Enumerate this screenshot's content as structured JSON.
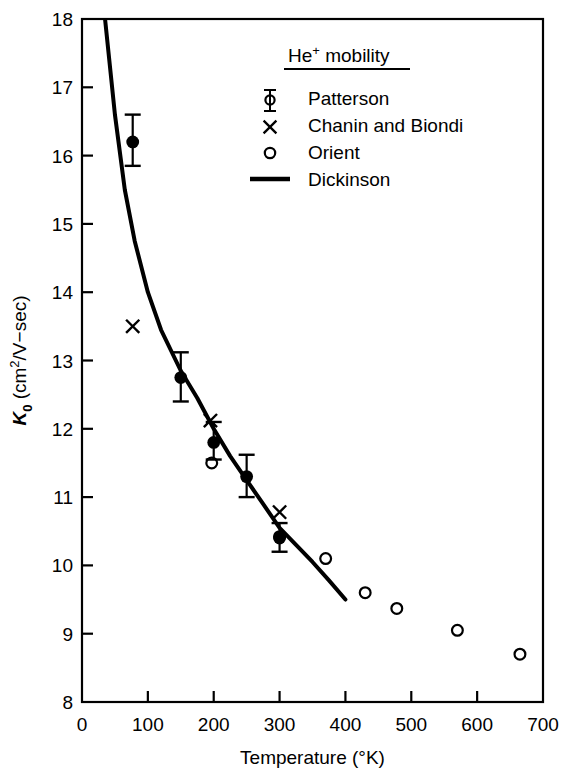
{
  "chart_data": {
    "type": "scatter",
    "title": "",
    "xlabel": "Temperature (°K)",
    "ylabel": "K0 (cm2/V−sec)",
    "ylabel_parts": {
      "symbol": "K",
      "subscript": "0",
      "units_pre": "(cm",
      "units_sup": "2",
      "units_post": "/V−sec)"
    },
    "xlim": [
      0,
      700
    ],
    "ylim": [
      8,
      18
    ],
    "xticks": [
      0,
      100,
      200,
      300,
      400,
      500,
      600,
      700
    ],
    "yticks": [
      8,
      9,
      10,
      11,
      12,
      13,
      14,
      15,
      16,
      17,
      18
    ],
    "grid": false,
    "tick_direction": "in",
    "legend_position": "upper right",
    "legend_title": "He⁺ mobility",
    "legend_title_parts": {
      "base": "He",
      "sup": "+",
      "rest": "mobility"
    },
    "series": [
      {
        "name": "Patterson",
        "marker": "filled-circle-errorbar",
        "points": [
          {
            "x": 77,
            "y": 16.2,
            "yerr_low": 15.85,
            "yerr_high": 16.6
          },
          {
            "x": 150,
            "y": 12.75,
            "yerr_low": 12.4,
            "yerr_high": 13.12
          },
          {
            "x": 200,
            "y": 11.8,
            "yerr_low": 11.55,
            "yerr_high": 12.1
          },
          {
            "x": 250,
            "y": 11.3,
            "yerr_low": 11.0,
            "yerr_high": 11.62
          },
          {
            "x": 300,
            "y": 10.4,
            "yerr_low": 10.2,
            "yerr_high": 10.62
          }
        ]
      },
      {
        "name": "Chanin and Biondi",
        "marker": "cross-x",
        "points": [
          {
            "x": 77,
            "y": 13.5
          },
          {
            "x": 195,
            "y": 12.12
          },
          {
            "x": 300,
            "y": 10.78
          }
        ]
      },
      {
        "name": "Orient",
        "marker": "open-circle",
        "points": [
          {
            "x": 197,
            "y": 11.5
          },
          {
            "x": 300,
            "y": 10.42
          },
          {
            "x": 370,
            "y": 10.1
          },
          {
            "x": 430,
            "y": 9.6
          },
          {
            "x": 478,
            "y": 9.37
          },
          {
            "x": 570,
            "y": 9.05
          },
          {
            "x": 665,
            "y": 8.7
          }
        ]
      },
      {
        "name": "Dickinson",
        "marker": "line",
        "points": [
          {
            "x": 35,
            "y": 18.0
          },
          {
            "x": 50,
            "y": 16.6
          },
          {
            "x": 65,
            "y": 15.5
          },
          {
            "x": 80,
            "y": 14.75
          },
          {
            "x": 100,
            "y": 14.0
          },
          {
            "x": 120,
            "y": 13.45
          },
          {
            "x": 150,
            "y": 12.85
          },
          {
            "x": 175,
            "y": 12.45
          },
          {
            "x": 200,
            "y": 12.0
          },
          {
            "x": 225,
            "y": 11.6
          },
          {
            "x": 250,
            "y": 11.25
          },
          {
            "x": 275,
            "y": 10.9
          },
          {
            "x": 300,
            "y": 10.55
          },
          {
            "x": 325,
            "y": 10.3
          },
          {
            "x": 350,
            "y": 10.05
          },
          {
            "x": 375,
            "y": 9.78
          },
          {
            "x": 400,
            "y": 9.5
          }
        ]
      }
    ]
  },
  "legend": {
    "title": "He⁺ mobility",
    "entries": [
      {
        "label": "Patterson",
        "marker": "errorbar-filled-circle"
      },
      {
        "label": "Chanin and Biondi",
        "marker": "cross-x"
      },
      {
        "label": "Orient",
        "marker": "open-circle"
      },
      {
        "label": "Dickinson",
        "marker": "line-segment"
      }
    ]
  },
  "axes": {
    "x_label": "Temperature (°K)",
    "x_tick_labels": [
      "0",
      "100",
      "200",
      "300",
      "400",
      "500",
      "600",
      "700"
    ],
    "y_tick_labels": [
      "18",
      "17",
      "16",
      "15",
      "14",
      "13",
      "12",
      "11",
      "10",
      "9",
      "8"
    ]
  },
  "colors": {
    "ink": "#000000",
    "background": "#ffffff"
  }
}
